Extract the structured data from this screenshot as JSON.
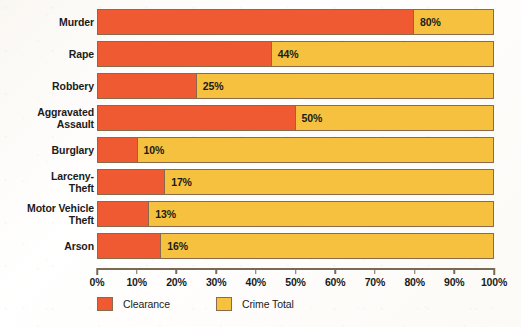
{
  "chart_data": {
    "type": "bar",
    "orientation": "horizontal",
    "stacked": true,
    "title": "",
    "subtitle": "",
    "xlabel": "",
    "ylabel": "",
    "xlim": [
      0,
      100
    ],
    "xtick_labels": [
      "0%",
      "10%",
      "20%",
      "30%",
      "40%",
      "50%",
      "60%",
      "70%",
      "80%",
      "90%",
      "100%"
    ],
    "xticks": [
      0,
      10,
      20,
      30,
      40,
      50,
      60,
      70,
      80,
      90,
      100
    ],
    "grid": false,
    "legend_position": "bottom-left",
    "categories": [
      "Murder",
      "Rape",
      "Robbery",
      "Aggravated\nAssault",
      "Burglary",
      "Larceny-\nTheft",
      "Motor Vehicle\nTheft",
      "Arson"
    ],
    "series": [
      {
        "name": "Clearance",
        "color": "#f05a32",
        "values": [
          80,
          44,
          25,
          50,
          10,
          17,
          13,
          16
        ]
      },
      {
        "name": "Crime Total",
        "color": "#f5c13e",
        "values": [
          100,
          100,
          100,
          100,
          100,
          100,
          100,
          100
        ]
      }
    ],
    "data_labels": [
      "80%",
      "44%",
      "25%",
      "50%",
      "10%",
      "17%",
      "13%",
      "16%"
    ]
  },
  "rows": [
    {
      "label": "Murder",
      "value": 80,
      "data_label": "80%"
    },
    {
      "label": "Rape",
      "value": 44,
      "data_label": "44%"
    },
    {
      "label": "Robbery",
      "value": 25,
      "data_label": "25%"
    },
    {
      "label": "Aggravated\nAssault",
      "value": 50,
      "data_label": "50%"
    },
    {
      "label": "Burglary",
      "value": 10,
      "data_label": "10%"
    },
    {
      "label": "Larceny-\nTheft",
      "value": 17,
      "data_label": "17%"
    },
    {
      "label": "Motor Vehicle\nTheft",
      "value": 13,
      "data_label": "13%"
    },
    {
      "label": "Arson",
      "value": 16,
      "data_label": "16%"
    }
  ],
  "axis": {
    "ticks": [
      {
        "value": 0,
        "label": "0%"
      },
      {
        "value": 10,
        "label": "10%"
      },
      {
        "value": 20,
        "label": "20%"
      },
      {
        "value": 30,
        "label": "30%"
      },
      {
        "value": 40,
        "label": "40%"
      },
      {
        "value": 50,
        "label": "50%"
      },
      {
        "value": 60,
        "label": "60%"
      },
      {
        "value": 70,
        "label": "70%"
      },
      {
        "value": 80,
        "label": "80%"
      },
      {
        "value": 90,
        "label": "90%"
      },
      {
        "value": 100,
        "label": "100%"
      }
    ]
  },
  "legend": {
    "items": [
      {
        "label": "Clearance",
        "color": "#f05a32"
      },
      {
        "label": "Crime Total",
        "color": "#f5c13e"
      }
    ]
  },
  "colors": {
    "clearance": "#f05a32",
    "crime_total": "#f5c13e",
    "bar_border": "#8a6a4a",
    "axis": "#7a6a55",
    "text": "#1b1b1b",
    "background": "#fffdfa"
  }
}
